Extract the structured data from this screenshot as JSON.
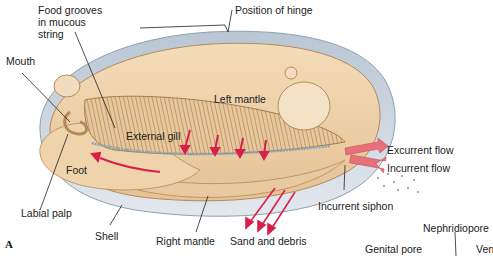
{
  "figure": {
    "panel_letter": "A"
  },
  "labels": {
    "food_grooves_1": "Food grooves",
    "food_grooves_2": "in mucous",
    "food_grooves_3": "string",
    "position_of_hinge": "Position of hinge",
    "mouth": "Mouth",
    "left_mantle": "Left mantle",
    "external_gill": "External gill",
    "foot": "Foot",
    "labial_palp": "Labial palp",
    "shell": "Shell",
    "right_mantle": "Right mantle",
    "sand_and_debris": "Sand and debris",
    "excurrent_flow": "Excurrent flow",
    "incurrent_flow": "Incurrent flow",
    "incurrent_siphon": "Incurrent siphon",
    "nephridiopore": "Nephridiopore",
    "genital_pore": "Genital pore",
    "ven_partial": "Ven"
  },
  "colors": {
    "body_tan": "#efd3ad",
    "shell_blue_gray": "#c9d3de",
    "flow_arrow_red": "#d8204a",
    "siphon_arrow_pink": "#e8707a",
    "leader_line": "#222222"
  }
}
